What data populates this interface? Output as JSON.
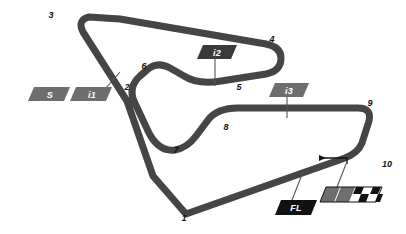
{
  "map": {
    "title": "Circuit Layout Map",
    "background_color": "#ffffff",
    "track_color": "#454545",
    "track_width_px": 7,
    "leader_line_color": "#555555"
  },
  "corner_numbers": [
    {
      "label": "1",
      "x": 184,
      "y": 221
    },
    {
      "label": "2",
      "x": 127,
      "y": 87
    },
    {
      "label": "3",
      "x": 51,
      "y": 15
    },
    {
      "label": "4",
      "x": 272,
      "y": 39
    },
    {
      "label": "5",
      "x": 238,
      "y": 87
    },
    {
      "label": "6",
      "x": 144,
      "y": 66
    },
    {
      "label": "7",
      "x": 176,
      "y": 150
    },
    {
      "label": "8",
      "x": 226,
      "y": 127
    },
    {
      "label": "9",
      "x": 369,
      "y": 103
    },
    {
      "label": "10",
      "x": 385,
      "y": 164
    }
  ],
  "sector_badges": [
    {
      "name": "start-badge",
      "label": "S",
      "style": "grey",
      "x": 34,
      "y": 87,
      "width": 34,
      "height": 14,
      "has_leader": false
    },
    {
      "name": "intermediate-1-badge",
      "label": "i1",
      "style": "grey",
      "x": 70,
      "y": 87,
      "width": 38,
      "height": 14,
      "has_leader": true,
      "leader": {
        "x1": 102,
        "y1": 88,
        "x2": 118,
        "y2": 73
      }
    },
    {
      "name": "intermediate-2-badge",
      "label": "i2",
      "style": "dark",
      "x": 198,
      "y": 45,
      "width": 34,
      "height": 14,
      "has_leader": true,
      "leader": {
        "x1": 215,
        "y1": 59,
        "x2": 215,
        "y2": 84
      }
    },
    {
      "name": "intermediate-3-badge",
      "label": "i3",
      "style": "grey",
      "x": 270,
      "y": 83,
      "width": 34,
      "height": 14,
      "has_leader": true,
      "leader": {
        "x1": 287,
        "y1": 97,
        "x2": 287,
        "y2": 117
      }
    },
    {
      "name": "fastest-lap-badge",
      "label": "FL",
      "style": "black",
      "x": 276,
      "y": 199,
      "width": 36,
      "height": 15,
      "has_leader": true,
      "leader": {
        "x1": 293,
        "y1": 199,
        "x2": 303,
        "y2": 172
      }
    }
  ],
  "finish_marker": {
    "name": "start-finish-checkered-flag",
    "x": 320,
    "y": 186,
    "width": 56,
    "height": 16,
    "grey_cells": 2,
    "checker_columns": 3,
    "checker_rows": 2,
    "leader": {
      "x1": 337,
      "y1": 186,
      "x2": 345,
      "y2": 164
    }
  },
  "direction_arrow": {
    "name": "race-direction-arrow",
    "description": "arrow pointing left indicating racing direction",
    "from_x": 347,
    "from_y": 163,
    "to_x": 316,
    "to_y": 159
  },
  "colors": {
    "track": "#454545",
    "badge_grey": "#6e6e6e",
    "badge_dark": "#3a3a3a",
    "badge_black": "#111111",
    "text_dark": "#141414",
    "text_light": "#ffffff"
  }
}
